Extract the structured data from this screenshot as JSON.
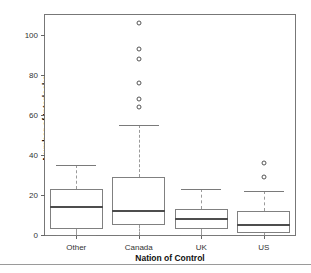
{
  "chart_data": {
    "type": "box",
    "title": "",
    "xlabel": "Nation of Control",
    "ylabel": "Number of Interlocks",
    "categories": [
      "Other",
      "Canada",
      "UK",
      "US"
    ],
    "ylim": [
      0,
      110
    ],
    "yticks": [
      0,
      20,
      40,
      60,
      80,
      100
    ],
    "ytick_labels": [
      "0",
      "20",
      "40",
      "60",
      "80",
      "100"
    ],
    "grid": false,
    "legend": null,
    "boxes": [
      {
        "category": "Other",
        "whisker_low": 0,
        "q1": 3,
        "median": 14,
        "q3": 23,
        "whisker_high": 35,
        "outliers": []
      },
      {
        "category": "Canada",
        "whisker_low": 0,
        "q1": 5,
        "median": 12,
        "q3": 29,
        "whisker_high": 55,
        "outliers": [
          64,
          68,
          76,
          88,
          93,
          106
        ]
      },
      {
        "category": "UK",
        "whisker_low": 0,
        "q1": 3,
        "median": 8,
        "q3": 13,
        "whisker_high": 23,
        "outliers": []
      },
      {
        "category": "US",
        "whisker_low": 0,
        "q1": 1,
        "median": 5,
        "q3": 12,
        "whisker_high": 22,
        "outliers": [
          29,
          36
        ]
      }
    ],
    "colors": {
      "box_stroke": "#808080",
      "median": "#4d4d4d",
      "whisker": "#9a9a9a",
      "outlier": "#555555",
      "axis": "#777777",
      "text": "#111111",
      "background": "#ffffff"
    }
  }
}
